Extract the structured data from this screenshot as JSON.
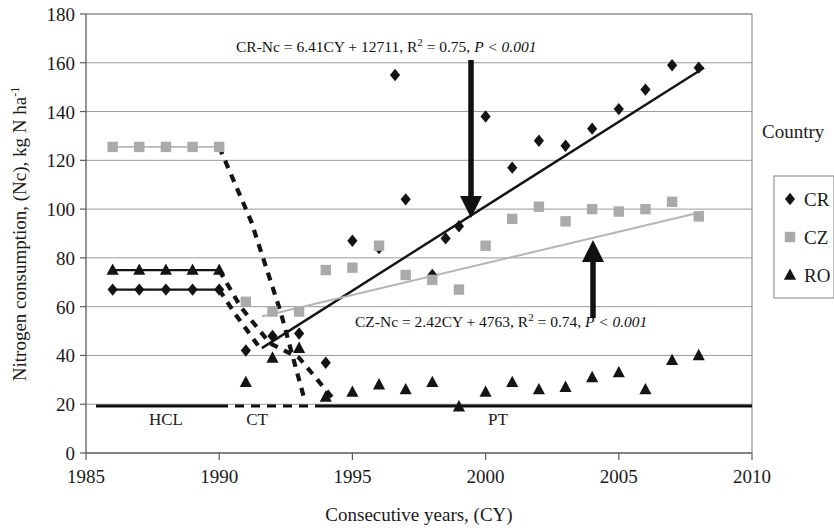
{
  "chart_data": {
    "type": "scatter",
    "title": "",
    "xlabel": "Consecutive years, (CY)",
    "ylabel": "Nitrogen consumption, (Nc), kg N ha-1",
    "ylabel_main": "Nitrogen consumption, (Nc), kg N ha",
    "ylabel_sup": "-1",
    "xlim": [
      1985,
      2010
    ],
    "ylim": [
      0,
      180
    ],
    "xticks": [
      "1985",
      "1990",
      "1995",
      "2000",
      "2005",
      "2010"
    ],
    "yticks": [
      "0",
      "20",
      "40",
      "60",
      "80",
      "100",
      "120",
      "140",
      "160",
      "180"
    ],
    "grid": "horizontal",
    "legend_position": "right",
    "legend_title": "Country",
    "series": [
      {
        "name": "CR",
        "marker": "diamond",
        "color": "#141414",
        "points": [
          {
            "x": 1986,
            "y": 67
          },
          {
            "x": 1987,
            "y": 67
          },
          {
            "x": 1988,
            "y": 67
          },
          {
            "x": 1989,
            "y": 67
          },
          {
            "x": 1990,
            "y": 67
          },
          {
            "x": 1991,
            "y": 42
          },
          {
            "x": 1992,
            "y": 48
          },
          {
            "x": 1993,
            "y": 49
          },
          {
            "x": 1994,
            "y": 37
          },
          {
            "x": 1995,
            "y": 87
          },
          {
            "x": 1996,
            "y": 84
          },
          {
            "x": 1996.6,
            "y": 155
          },
          {
            "x": 1997,
            "y": 104
          },
          {
            "x": 1998,
            "y": 73
          },
          {
            "x": 1998.5,
            "y": 88
          },
          {
            "x": 1999,
            "y": 93
          },
          {
            "x": 2000,
            "y": 138
          },
          {
            "x": 2001,
            "y": 117
          },
          {
            "x": 2002,
            "y": 128
          },
          {
            "x": 2003,
            "y": 126
          },
          {
            "x": 2004,
            "y": 133
          },
          {
            "x": 2005,
            "y": 141
          },
          {
            "x": 2006,
            "y": 149
          },
          {
            "x": 2007,
            "y": 159
          },
          {
            "x": 2008,
            "y": 158
          }
        ]
      },
      {
        "name": "CZ",
        "marker": "square",
        "color": "#aaaaaa",
        "points": [
          {
            "x": 1986,
            "y": 125.5
          },
          {
            "x": 1987,
            "y": 125.5
          },
          {
            "x": 1988,
            "y": 125.5
          },
          {
            "x": 1989,
            "y": 125.5
          },
          {
            "x": 1990,
            "y": 125.5
          },
          {
            "x": 1991,
            "y": 62
          },
          {
            "x": 1992,
            "y": 58
          },
          {
            "x": 1993,
            "y": 58
          },
          {
            "x": 1994,
            "y": 75
          },
          {
            "x": 1995,
            "y": 76
          },
          {
            "x": 1996,
            "y": 85
          },
          {
            "x": 1997,
            "y": 73
          },
          {
            "x": 1998,
            "y": 71
          },
          {
            "x": 1999,
            "y": 67
          },
          {
            "x": 2000,
            "y": 85
          },
          {
            "x": 2001,
            "y": 96
          },
          {
            "x": 2002,
            "y": 101
          },
          {
            "x": 2003,
            "y": 95
          },
          {
            "x": 2004,
            "y": 100
          },
          {
            "x": 2005,
            "y": 99
          },
          {
            "x": 2006,
            "y": 100
          },
          {
            "x": 2007,
            "y": 103
          },
          {
            "x": 2008,
            "y": 97
          }
        ]
      },
      {
        "name": "RO",
        "marker": "triangle",
        "color": "#141414",
        "points": [
          {
            "x": 1986,
            "y": 75
          },
          {
            "x": 1987,
            "y": 75
          },
          {
            "x": 1988,
            "y": 75
          },
          {
            "x": 1989,
            "y": 75
          },
          {
            "x": 1990,
            "y": 75
          },
          {
            "x": 1991,
            "y": 29
          },
          {
            "x": 1992,
            "y": 39
          },
          {
            "x": 1993,
            "y": 43
          },
          {
            "x": 1994,
            "y": 23
          },
          {
            "x": 1995,
            "y": 25
          },
          {
            "x": 1996,
            "y": 28
          },
          {
            "x": 1997,
            "y": 26
          },
          {
            "x": 1998,
            "y": 29
          },
          {
            "x": 1999,
            "y": 19
          },
          {
            "x": 2000,
            "y": 25
          },
          {
            "x": 2001,
            "y": 29
          },
          {
            "x": 2002,
            "y": 26
          },
          {
            "x": 2003,
            "y": 27
          },
          {
            "x": 2004,
            "y": 31
          },
          {
            "x": 2005,
            "y": 33
          },
          {
            "x": 2006,
            "y": 26
          },
          {
            "x": 2007,
            "y": 38
          },
          {
            "x": 2008,
            "y": 40
          }
        ]
      }
    ],
    "trendlines": [
      {
        "name": "CR-trend",
        "color": "#141414",
        "width": 2.4,
        "x1": 1991.6,
        "y1": 43,
        "x2": 2008.2,
        "y2": 158
      },
      {
        "name": "CZ-trend",
        "color": "#b5b5b5",
        "width": 2.0,
        "x1": 1991.6,
        "y1": 56,
        "x2": 2008.2,
        "y2": 99
      }
    ],
    "connector_lines": [
      {
        "name": "cz-flat-line",
        "color": "#b5b5b5",
        "width": 1.6,
        "x1": 1986,
        "y1": 125.5,
        "x2": 1990,
        "y2": 125.5
      },
      {
        "name": "ro-flat-line",
        "color": "#141414",
        "width": 2.4,
        "x1": 1986,
        "y1": 75,
        "x2": 1990,
        "y2": 75
      },
      {
        "name": "cr-flat-line",
        "color": "#141414",
        "width": 2.4,
        "x1": 1986,
        "y1": 67,
        "x2": 1990,
        "y2": 67
      }
    ],
    "dashed_paths": [
      {
        "name": "cz-drop-dashed",
        "points": [
          [
            1990,
            125.5
          ],
          [
            1991.2,
            95
          ],
          [
            1992.3,
            58
          ],
          [
            1993.2,
            22
          ]
        ]
      },
      {
        "name": "cr-drop-dashed",
        "points": [
          [
            1990,
            67
          ],
          [
            1990.6,
            57
          ],
          [
            1991.6,
            42
          ]
        ]
      },
      {
        "name": "ro-drop-dashed",
        "points": [
          [
            1990,
            75
          ],
          [
            1990.8,
            60
          ],
          [
            1991.9,
            45
          ],
          [
            1993,
            39
          ],
          [
            1994.3,
            22
          ]
        ]
      }
    ],
    "annotations": [
      {
        "name": "cr-equation",
        "prefix": "CR-Nc = 6.41CY + 12711,  R",
        "sup": "2",
        "mid": " = 0.75, ",
        "italic": "P < 0.001",
        "x": 236,
        "y": 52
      },
      {
        "name": "cz-equation",
        "prefix": "CZ-Nc = 2.42CY + 4763, R",
        "sup": "2",
        "mid": " = 0.74, ",
        "italic": "P < 0.001",
        "x": 355,
        "y": 327
      }
    ],
    "arrows": [
      {
        "name": "cr-down-arrow",
        "direction": "down",
        "x": 471,
        "y_tail": 60,
        "y_head": 218
      },
      {
        "name": "cz-up-arrow",
        "direction": "up",
        "x": 593,
        "y_tail": 318,
        "y_head": 240
      }
    ],
    "phases": [
      {
        "name": "phase-hcl",
        "label": "HCL",
        "label_x": 166,
        "label_y": 425,
        "line_x1": 96,
        "line_x2": 219,
        "style": "solid"
      },
      {
        "name": "phase-ct",
        "label": "CT",
        "label_x": 257,
        "label_y": 425,
        "line_x1": 219,
        "line_x2": 317,
        "style": "dashed"
      },
      {
        "name": "phase-pt",
        "label": "PT",
        "label_x": 498,
        "label_y": 425,
        "line_x1": 317,
        "line_x2": 752,
        "style": "solid"
      }
    ]
  },
  "legend": {
    "title": "Country",
    "items": [
      {
        "label": "CR",
        "marker": "diamond",
        "color": "#141414"
      },
      {
        "label": "CZ",
        "marker": "square",
        "color": "#aaaaaa"
      },
      {
        "label": "RO",
        "marker": "triangle",
        "color": "#141414"
      }
    ]
  }
}
